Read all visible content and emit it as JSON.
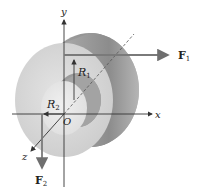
{
  "diagram": {
    "type": "mechanics-free-body",
    "axes": {
      "x_label": "x",
      "y_label": "y",
      "z_label": "z",
      "origin_label": "O"
    },
    "radii": {
      "outer": {
        "label": "R",
        "subscript": "1"
      },
      "inner": {
        "label": "R",
        "subscript": "2"
      }
    },
    "forces": [
      {
        "label": "F",
        "subscript": "1",
        "direction": "+x",
        "applied_at": "top of outer radius R1"
      },
      {
        "label": "F",
        "subscript": "2",
        "direction": "-y",
        "applied_at": "left of inner radius R2"
      }
    ],
    "colors": {
      "axis": "#333333",
      "force_arrow": "#777777",
      "cylinder_face": "#d6d6d6",
      "cylinder_side_dark": "#8a8a8a",
      "cylinder_side_light": "#bdbdbd",
      "inner_face": "#e6e6e6"
    }
  }
}
